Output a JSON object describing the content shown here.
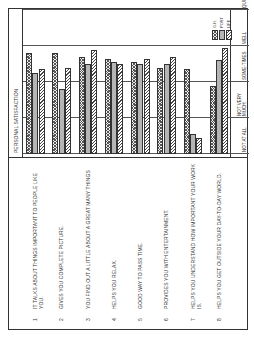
{
  "chart_data": {
    "type": "bar",
    "orientation": "horizontal",
    "rotated_page": true,
    "title": "PERSONAL SATISFACTION",
    "categories": [
      "1 IT TALKS ABOUT THINGS IMPORTANT TO PEOPLE LIKE YOU.",
      "2 GIVES YOU COMPLETE PICTURE.",
      "3 YOU FIND OUT A LITTLE ABOUT A GREAT MANY THINGS",
      "4 HELPS YOU RELAX.",
      "5 GOOD WAY TO PASS TIME.",
      "6 PROVIDES YOU WITH ENTERTAINMENT.",
      "7 HELPS YOU UNDERSTAND HOW IMPORTANT YOUR WORK IS.",
      "8 HELPS YOU GET OUTSIDE YOUR DAY-TO-DAY WORLD."
    ],
    "series": [
      {
        "name": "G.H.",
        "values": [
          2.8,
          2.8,
          2.7,
          2.65,
          2.55,
          2.4,
          2.35,
          1.9
        ]
      },
      {
        "name": "POST",
        "values": [
          2.25,
          1.8,
          2.5,
          2.55,
          2.5,
          2.5,
          0.55,
          2.6
        ]
      },
      {
        "name": "LIFE",
        "values": [
          2.35,
          2.4,
          2.9,
          2.5,
          2.65,
          2.7,
          0.45,
          2.95
        ]
      }
    ],
    "xlabel": "",
    "ylabel": "",
    "scale_labels": [
      "NOT AT ALL",
      "NOT VERY MUCH",
      "SOME-TIMES",
      "WELL",
      "QUITE WELL"
    ],
    "xlim": [
      0,
      4
    ],
    "grid": true,
    "legend_position": "upper right"
  },
  "statements": [
    {
      "num": "1",
      "text": "IT TALKS ABOUT THINGS IMPORTANT TO PEOPLE LIKE YOU."
    },
    {
      "num": "2",
      "text": "GIVES YOU COMPLETE PICTURE."
    },
    {
      "num": "3",
      "text": "YOU FIND OUT A LITTLE ABOUT A GREAT MANY THINGS"
    },
    {
      "num": "4",
      "text": "HELPS YOU RELAX."
    },
    {
      "num": "5",
      "text": "GOOD WAY TO PASS TIME."
    },
    {
      "num": "6",
      "text": "PROVIDES YOU WITH ENTERTAINMENT."
    },
    {
      "num": "7",
      "text": "HELPS YOU UNDERSTAND HOW IMPORTANT YOUR WORK IS."
    },
    {
      "num": "8",
      "text": "HELPS YOU GET OUTSIDE YOUR DAY-TO-DAY WORLD."
    }
  ],
  "plot_title": "PERSONAL SATISFACTION",
  "ticks": [
    "NOT AT ALL",
    "NOT VERY MUCH",
    "SOME-TIMES",
    "WELL",
    "QUITE WELL"
  ],
  "legend": [
    {
      "label": "G.H.",
      "cls": "gh"
    },
    {
      "label": "POST",
      "cls": "post"
    },
    {
      "label": "LIFE",
      "cls": "life"
    }
  ]
}
